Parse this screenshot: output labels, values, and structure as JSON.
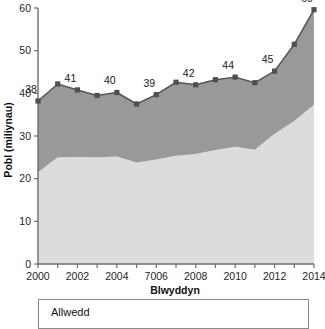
{
  "chart_data": {
    "type": "area",
    "title": "",
    "xlabel": "Blwyddyn",
    "ylabel": "Pobl (miliynau)",
    "xlim": [
      2000,
      2014
    ],
    "ylim": [
      0,
      60
    ],
    "grid": false,
    "legend_position": "bottom",
    "x": [
      2000,
      2001,
      2002,
      2003,
      2004,
      2005,
      2006,
      2007,
      2008,
      2009,
      2010,
      2011,
      2012,
      2013,
      2014
    ],
    "xtick_labels": [
      "2000",
      "2002",
      "2004",
      "7006",
      "2008",
      "2010",
      "2012",
      "2014"
    ],
    "xtick_values": [
      2000,
      2002,
      2004,
      2006,
      2008,
      2010,
      2012,
      2014
    ],
    "ytick_labels": [
      "0",
      "10",
      "20",
      "30",
      "40",
      "50",
      "60"
    ],
    "ytick_values": [
      0,
      10,
      20,
      30,
      40,
      50,
      60
    ],
    "series": [
      {
        "name": "lower-band",
        "color": "#dcdcdc",
        "values": [
          21.5,
          25.0,
          25.1,
          25.0,
          25.2,
          23.8,
          24.5,
          25.4,
          25.8,
          26.7,
          27.5,
          26.8,
          30.5,
          33.5,
          37.3
        ]
      },
      {
        "name": "upper-band",
        "color": "#999999",
        "values": [
          38.2,
          42.2,
          40.8,
          39.5,
          40.2,
          37.5,
          39.7,
          42.6,
          42.0,
          43.2,
          43.8,
          42.5,
          45.2,
          51.5,
          59.6
        ]
      }
    ],
    "point_labels": [
      {
        "x": 2000,
        "y": 38.2,
        "text": "38"
      },
      {
        "x": 2002,
        "y": 40.8,
        "text": "41"
      },
      {
        "x": 2004,
        "y": 40.2,
        "text": "40"
      },
      {
        "x": 2006,
        "y": 39.7,
        "text": "39"
      },
      {
        "x": 2008,
        "y": 42.0,
        "text": "42"
      },
      {
        "x": 2010,
        "y": 43.8,
        "text": "44"
      },
      {
        "x": 2012,
        "y": 45.2,
        "text": "45"
      },
      {
        "x": 2014,
        "y": 59.6,
        "text": "60"
      }
    ]
  },
  "legend": {
    "title": "Allwedd"
  }
}
